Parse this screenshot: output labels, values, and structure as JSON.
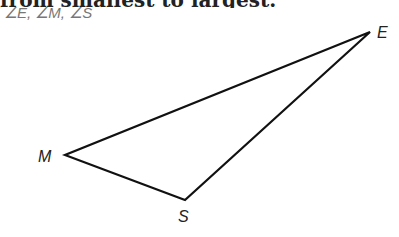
{
  "heading": "from smallest to largest.",
  "subtitle": "∠E, ∠M, ∠S",
  "diagram": {
    "type": "triangle",
    "line_color": "#111111",
    "vertices": [
      {
        "label": "E",
        "x": 370,
        "y": 32,
        "label_x": 377,
        "label_y": 38
      },
      {
        "label": "M",
        "x": 65,
        "y": 155,
        "label_x": 38,
        "label_y": 162
      },
      {
        "label": "S",
        "x": 185,
        "y": 200,
        "label_x": 178,
        "label_y": 222
      }
    ]
  }
}
